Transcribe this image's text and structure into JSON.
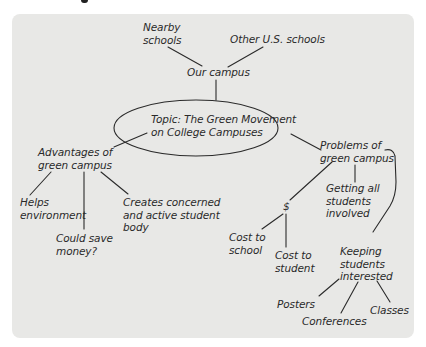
{
  "title_fragment": "",
  "diagram": {
    "type": "cluster-map",
    "topic": {
      "label": "Topic: The Green Movement\non College Campuses"
    },
    "nodes": {
      "our_campus": "Our campus",
      "nearby_schools": "Nearby\nschools",
      "other_us_schools": "Other U.S. schools",
      "advantages": "Advantages of\ngreen campus",
      "helps_environment": "Helps\nenvironment",
      "could_save_money": "Could save\nmoney?",
      "creates_concerned": "Creates concerned\nand active student\nbody",
      "problems": "Problems of\ngreen campus",
      "dollar": "$",
      "cost_to_school": "Cost to\nschool",
      "cost_to_student": "Cost to\nstudent",
      "getting_all_students": "Getting all\nstudents\ninvolved",
      "keeping_students": "Keeping\nstudents\ninterested",
      "posters": "Posters",
      "conferences": "Conferences",
      "classes": "Classes"
    },
    "edges": [
      [
        "topic",
        "our_campus"
      ],
      [
        "our_campus",
        "nearby_schools"
      ],
      [
        "our_campus",
        "other_us_schools"
      ],
      [
        "topic",
        "advantages"
      ],
      [
        "topic",
        "problems"
      ],
      [
        "advantages",
        "helps_environment"
      ],
      [
        "advantages",
        "could_save_money"
      ],
      [
        "advantages",
        "creates_concerned"
      ],
      [
        "problems",
        "dollar"
      ],
      [
        "problems",
        "getting_all_students"
      ],
      [
        "problems",
        "keeping_students"
      ],
      [
        "dollar",
        "cost_to_school"
      ],
      [
        "dollar",
        "cost_to_student"
      ],
      [
        "keeping_students",
        "posters"
      ],
      [
        "keeping_students",
        "conferences"
      ],
      [
        "keeping_students",
        "classes"
      ]
    ],
    "colors": {
      "panel": "#e8e8e6",
      "line": "#2a2a2a",
      "text": "#2a2a2a"
    }
  }
}
